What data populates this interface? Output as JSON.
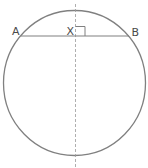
{
  "diagram": {
    "type": "geometry-circle-chord",
    "labels": {
      "A": "A",
      "X": "X",
      "B": "B"
    },
    "colors": {
      "stroke": "#808080",
      "label": "#4a4a4a",
      "background": "#ffffff"
    },
    "elements": {
      "circle": "circle",
      "chord": "chord AB",
      "perpendicular_bisector": "dashed vertical line through X",
      "right_angle_marker": "right angle at X"
    }
  }
}
